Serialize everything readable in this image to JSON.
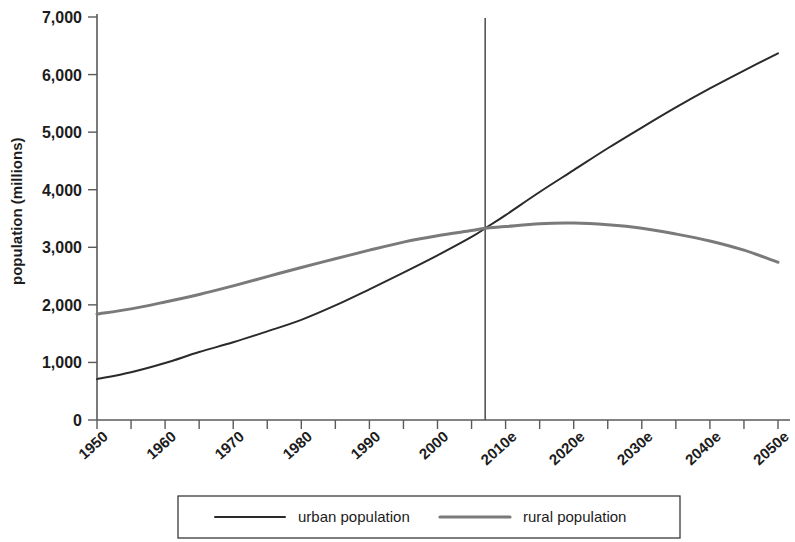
{
  "chart_data": {
    "type": "line",
    "title": "",
    "xlabel": "",
    "ylabel": "population (millions)",
    "grid": false,
    "legend_position": "bottom",
    "xlim": [
      1950,
      2050
    ],
    "ylim": [
      0,
      7000
    ],
    "x_tick_labels": [
      "1950",
      "1960",
      "1970",
      "1980",
      "1990",
      "2000",
      "2010e",
      "2020e",
      "2030e",
      "2040e",
      "2050e"
    ],
    "x_tick_values": [
      1950,
      1960,
      1970,
      1980,
      1990,
      2000,
      2010,
      2020,
      2030,
      2040,
      2050
    ],
    "x_minor_tick_values": [
      1955,
      1965,
      1975,
      1985,
      1995,
      2005,
      2015,
      2025,
      2035,
      2045
    ],
    "y_tick_labels": [
      "0",
      "1,000",
      "2,000",
      "3,000",
      "4,000",
      "5,000",
      "6,000",
      "7,000"
    ],
    "y_tick_values": [
      0,
      1000,
      2000,
      3000,
      4000,
      5000,
      6000,
      7000
    ],
    "annotations": [
      {
        "name": "crossover-reference-line",
        "type": "vline",
        "x": 2007,
        "label": ""
      }
    ],
    "series": [
      {
        "name": "urban population",
        "color": "#2a2a2a",
        "width": 2.0,
        "x": [
          1950,
          1955,
          1960,
          1965,
          1970,
          1975,
          1980,
          1985,
          1990,
          1995,
          2000,
          2005,
          2007,
          2010,
          2015,
          2020,
          2025,
          2030,
          2035,
          2040,
          2045,
          2050
        ],
        "values": [
          710,
          830,
          990,
          1180,
          1350,
          1540,
          1740,
          1990,
          2270,
          2560,
          2860,
          3180,
          3330,
          3560,
          3960,
          4340,
          4720,
          5080,
          5430,
          5760,
          6070,
          6370
        ]
      },
      {
        "name": "rural population",
        "color": "#7a7a7a",
        "width": 3.0,
        "x": [
          1950,
          1955,
          1960,
          1965,
          1970,
          1975,
          1980,
          1985,
          1990,
          1995,
          2000,
          2005,
          2007,
          2010,
          2015,
          2020,
          2025,
          2030,
          2035,
          2040,
          2045,
          2050
        ],
        "values": [
          1840,
          1930,
          2050,
          2180,
          2330,
          2490,
          2650,
          2800,
          2950,
          3090,
          3200,
          3290,
          3330,
          3360,
          3410,
          3420,
          3390,
          3330,
          3230,
          3110,
          2950,
          2740
        ]
      }
    ]
  },
  "legend": {
    "items": [
      {
        "label": "urban population",
        "color": "#2a2a2a",
        "width": 2.0
      },
      {
        "label": "rural population",
        "color": "#7a7a7a",
        "width": 3.2
      }
    ]
  }
}
